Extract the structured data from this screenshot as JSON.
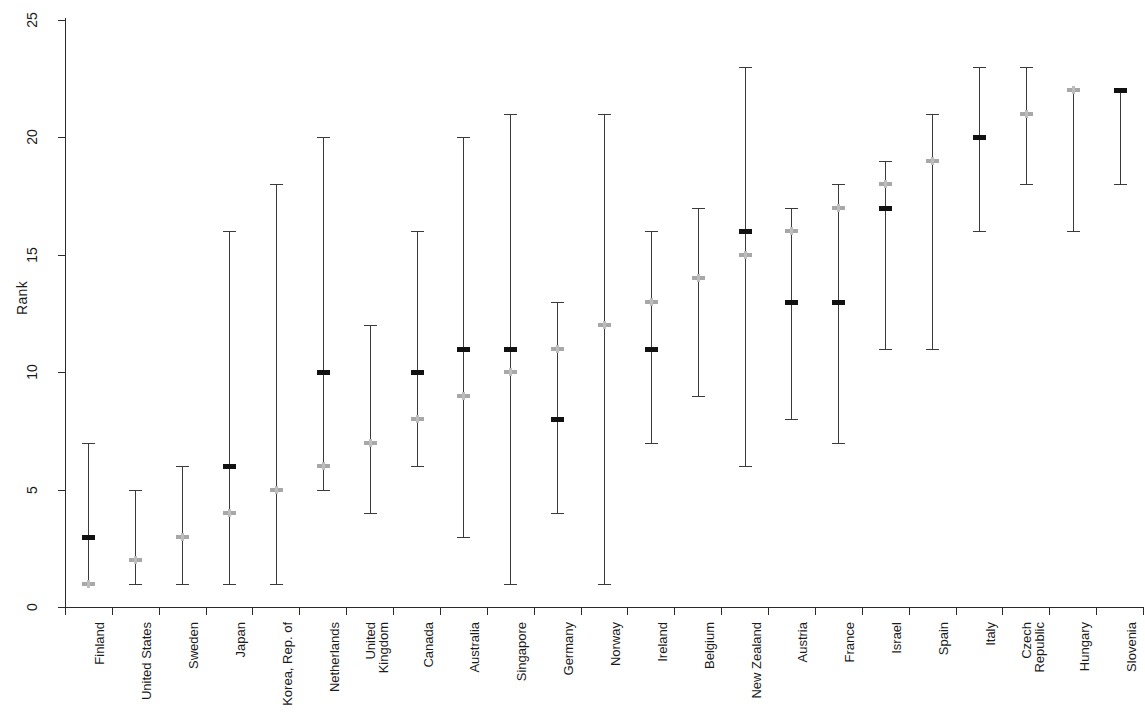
{
  "chart_data": {
    "type": "range-dot",
    "title": "",
    "xlabel": "",
    "ylabel": "Rank",
    "ylim": [
      0,
      25
    ],
    "yticks": [
      0,
      5,
      10,
      15,
      20,
      25
    ],
    "grid": false,
    "legend": "none",
    "colors": {
      "dark_marker": "#111111",
      "light_marker": "#a8a8a8",
      "range_line": "#3a3a3a",
      "axis": "#2a2a2a"
    },
    "categories": [
      "Finland",
      "United States",
      "Sweden",
      "Japan",
      "Korea, Rep. of",
      "Netherlands",
      "United Kingdom",
      "Canada",
      "Australia",
      "Singapore",
      "Germany",
      "Norway",
      "Ireland",
      "Belgium",
      "New Zealand",
      "Austria",
      "France",
      "Israel",
      "Spain",
      "Italy",
      "Czech Republic",
      "Hungary",
      "Slovenia"
    ],
    "category_lines": [
      [
        "Finland"
      ],
      [
        "United States"
      ],
      [
        "Sweden"
      ],
      [
        "Japan"
      ],
      [
        "Korea, Rep. of"
      ],
      [
        "Netherlands"
      ],
      [
        "United",
        "Kingdom"
      ],
      [
        "Canada"
      ],
      [
        "Australia"
      ],
      [
        "Singapore"
      ],
      [
        "Germany"
      ],
      [
        "Norway"
      ],
      [
        "Ireland"
      ],
      [
        "Belgium"
      ],
      [
        "New Zealand"
      ],
      [
        "Austria"
      ],
      [
        "France"
      ],
      [
        "Israel"
      ],
      [
        "Spain"
      ],
      [
        "Italy"
      ],
      [
        "Czech",
        "Republic"
      ],
      [
        "Hungary"
      ],
      [
        "Slovenia"
      ]
    ],
    "series": [
      {
        "name": "Range (low-high)",
        "low": [
          1,
          1,
          1,
          1,
          1,
          5,
          4,
          6,
          3,
          1,
          4,
          1,
          7,
          9,
          6,
          8,
          7,
          11,
          11,
          16,
          18,
          16,
          18
        ],
        "high": [
          7,
          5,
          6,
          16,
          18,
          20,
          12,
          16,
          20,
          21,
          13,
          21,
          16,
          17,
          23,
          17,
          18,
          19,
          21,
          23,
          23,
          22,
          22
        ]
      },
      {
        "name": "Dark marker",
        "values": [
          3,
          null,
          null,
          6,
          null,
          10,
          null,
          10,
          11,
          11,
          8,
          null,
          11,
          null,
          16,
          13,
          13,
          17,
          null,
          20,
          null,
          null,
          22
        ]
      },
      {
        "name": "Light marker",
        "values": [
          1,
          2,
          3,
          4,
          5,
          6,
          7,
          8,
          9,
          10,
          11,
          12,
          13,
          14,
          15,
          16,
          17,
          18,
          19,
          null,
          21,
          22,
          null
        ]
      }
    ]
  }
}
